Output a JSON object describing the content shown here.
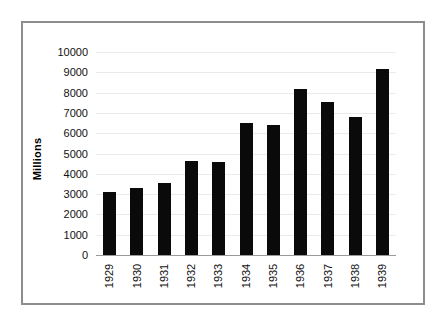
{
  "chart_data": {
    "type": "bar",
    "title": "",
    "subtitle": "",
    "xlabel": "",
    "ylabel": "Millions",
    "categories": [
      "1929",
      "1930",
      "1931",
      "1932",
      "1933",
      "1934",
      "1935",
      "1936",
      "1937",
      "1938",
      "1939"
    ],
    "values": [
      3100,
      3300,
      3550,
      4650,
      4600,
      6500,
      6400,
      8200,
      7550,
      6800,
      9150
    ],
    "ylim": [
      0,
      10000
    ],
    "ytick_labels": [
      "10000",
      "9000",
      "8000",
      "7000",
      "6000",
      "5000",
      "4000",
      "3000",
      "2000",
      "1000",
      "0"
    ],
    "ytick_values": [
      10000,
      9000,
      8000,
      7000,
      6000,
      5000,
      4000,
      3000,
      2000,
      1000,
      0
    ],
    "ytick_interval": 1000,
    "grid": true,
    "legend": false,
    "legend_position": "none",
    "bar_color": "#0a0a0a",
    "gridline_color": "#ebebeb",
    "axis_color": "#9a9a9a",
    "frame_color": "#8d8d8d",
    "background_color": "#ffffff",
    "xtick_rotation": 90,
    "ylabel_rotation": 90
  }
}
